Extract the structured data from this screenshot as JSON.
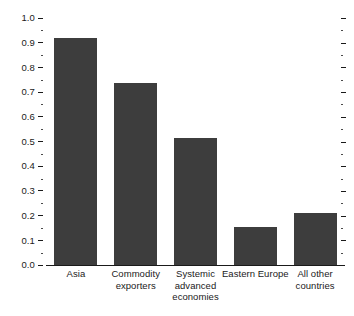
{
  "chart_data": {
    "type": "bar",
    "title": "",
    "subtitle": "",
    "xlabel": "",
    "ylabel": "",
    "ylim": [
      0.0,
      1.0
    ],
    "grid": false,
    "legend": false,
    "bar_color": "#3d3d3d",
    "axis_color": "#1a1a1a",
    "background": "#ffffff",
    "y_major_step": 0.1,
    "y_minor_step": 0.05,
    "categories": [
      "Asia",
      "Commodity exporters",
      "Systemic advanced economies",
      "Eastern Europe",
      "All other countries"
    ],
    "category_lines": [
      [
        "Asia"
      ],
      [
        "Commodity",
        "exporters"
      ],
      [
        "Systemic",
        "advanced",
        "economies"
      ],
      [
        "Eastern Europe"
      ],
      [
        "All other",
        "countries"
      ]
    ],
    "values": [
      0.92,
      0.735,
      0.513,
      0.155,
      0.21
    ],
    "y_tick_labels": [
      "0.0",
      "0.1",
      "0.2",
      "0.3",
      "0.4",
      "0.5",
      "0.6",
      "0.7",
      "0.8",
      "0.9",
      "1.0"
    ],
    "y_tick_values": [
      0.0,
      0.1,
      0.2,
      0.3,
      0.4,
      0.5,
      0.6,
      0.7,
      0.8,
      0.9,
      1.0
    ],
    "y_minor_values": [
      0.05,
      0.15,
      0.25,
      0.35,
      0.45,
      0.55,
      0.65,
      0.75,
      0.85,
      0.95
    ]
  }
}
